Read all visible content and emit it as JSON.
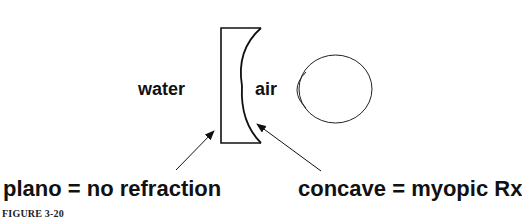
{
  "figure": {
    "caption": "FIGURE 3-20",
    "labels": {
      "left_medium": "water",
      "right_medium": "air",
      "plano_annotation": "plano = no refraction",
      "concave_annotation": "concave = myopic Rx"
    },
    "elements": {
      "lens": "plano-concave lens (flat side facing water, concave side facing air)",
      "eye": "eye with cornea facing the lens"
    },
    "colors": {
      "stroke": "#111111",
      "background": "#ffffff"
    }
  }
}
